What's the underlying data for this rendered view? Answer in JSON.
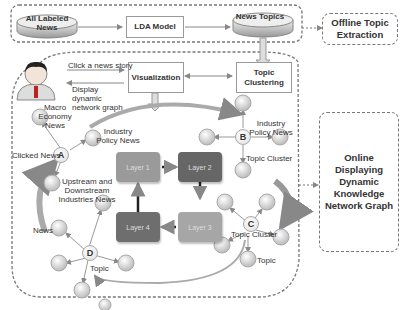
{
  "offline": {
    "source": "All Labeled News",
    "model": "LDA Model",
    "topics": "News Topics",
    "side_label": "Offline Topic Extraction"
  },
  "online": {
    "click_action": "Click a news story",
    "display_action": "Display dynamic network graph",
    "visualization": "Visualization",
    "topic_clustering": "Topic Clustering",
    "side_label": "Online Displaying Dynamic Knowledge Network Graph"
  },
  "graph": {
    "node_a": {
      "id": "A",
      "label": "Clicked News",
      "neighbors": [
        "Macro Economy News",
        "Industry Policy News",
        "Upstream and Downstream Industries News"
      ]
    },
    "node_b": {
      "id": "B",
      "labels": [
        "Industry Policy News",
        "Topic Cluster"
      ]
    },
    "node_c": {
      "id": "C",
      "labels": [
        "Topic Cluster",
        "Topic"
      ]
    },
    "node_d": {
      "id": "D",
      "labels": [
        "News",
        "Topic"
      ]
    }
  },
  "layers": [
    {
      "label": "Layer 1",
      "color": "#9a9a9a"
    },
    {
      "label": "Layer 2",
      "color": "#666666"
    },
    {
      "label": "Layer 3",
      "color": "#a6a6a6"
    },
    {
      "label": "Layer 4",
      "color": "#6e6e6e"
    }
  ]
}
